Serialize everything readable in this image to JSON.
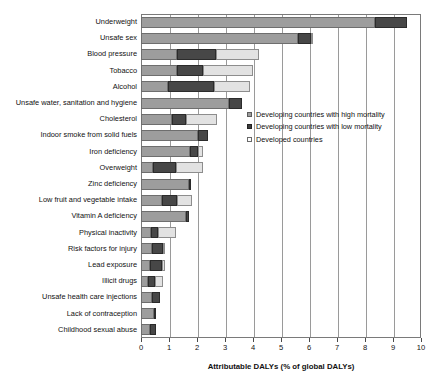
{
  "chart_data": {
    "type": "bar",
    "orientation": "horizontal",
    "stacked": true,
    "title": "",
    "xlabel": "Attributable DALYs (% of global DALYs)",
    "ylabel": "",
    "xlim": [
      0,
      10
    ],
    "xticks": [
      "0",
      "1",
      "2",
      "3",
      "4",
      "5",
      "6",
      "7",
      "8",
      "9",
      "10"
    ],
    "grid": "vertical",
    "legend_position": "inside-right",
    "legend": [
      "Developing countries with high mortality",
      "Developing countries with low mortality",
      "Developed countries"
    ],
    "categories": [
      "Underweight",
      "Unsafe sex",
      "Blood pressure",
      "Tobacco",
      "Alcohol",
      "Unsafe water, sanitation and hygiene",
      "Cholesterol",
      "Indoor smoke from solid fuels",
      "Iron deficiency",
      "Overweight",
      "Zinc deficiency",
      "Low fruit and vegetable intake",
      "Vitamin A deficiency",
      "Physical inactivity",
      "Risk factors for injury",
      "Lead exposure",
      "Illicit drugs",
      "Unsafe health care injections",
      "Lack of contraception",
      "Childhood sexual abuse"
    ],
    "series": [
      {
        "name": "Developing countries with high mortality",
        "color": "#9d9d9d",
        "values": [
          8.35,
          5.6,
          1.3,
          1.3,
          0.95,
          3.15,
          1.1,
          2.05,
          1.75,
          0.43,
          1.72,
          0.75,
          1.6,
          0.36,
          0.4,
          0.32,
          0.24,
          0.4,
          0.5,
          0.33
        ]
      },
      {
        "name": "Developing countries with low mortality",
        "color": "#474747",
        "values": [
          1.15,
          0.47,
          1.38,
          0.9,
          1.65,
          0.45,
          0.5,
          0.35,
          0.3,
          0.82,
          0.08,
          0.55,
          0.12,
          0.24,
          0.38,
          0.43,
          0.26,
          0.28,
          0.05,
          0.22
        ]
      },
      {
        "name": "Developed countries",
        "color": "#e2e2e2",
        "values": [
          0.0,
          0.08,
          1.52,
          1.8,
          1.3,
          0.0,
          1.1,
          0.0,
          0.15,
          0.95,
          0.0,
          0.52,
          0.0,
          0.65,
          0.07,
          0.1,
          0.28,
          0.0,
          0.0,
          0.0
        ]
      }
    ],
    "totals": [
      9.5,
      6.15,
      4.2,
      4.0,
      3.9,
      3.6,
      2.7,
      2.4,
      2.2,
      2.2,
      1.8,
      1.82,
      1.72,
      1.25,
      0.85,
      0.85,
      0.78,
      0.68,
      0.55,
      0.55
    ]
  }
}
